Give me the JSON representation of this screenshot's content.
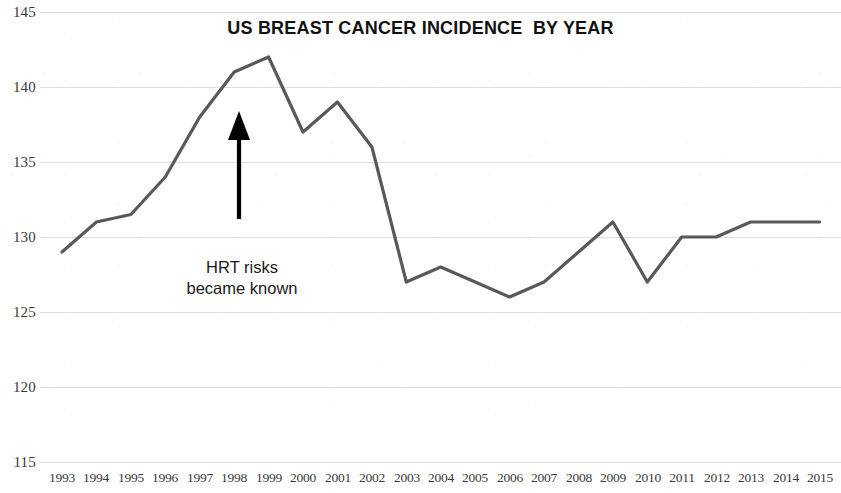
{
  "chart_data": {
    "type": "line",
    "title": "US BREAST CANCER INCIDENCE  BY YEAR",
    "xlabel": "",
    "ylabel": "",
    "categories": [
      "1993",
      "1994",
      "1995",
      "1996",
      "1997",
      "1998",
      "1999",
      "2000",
      "2001",
      "2002",
      "2003",
      "2004",
      "2005",
      "2006",
      "2007",
      "2008",
      "2009",
      "2010",
      "2011",
      "2012",
      "2013",
      "2014",
      "2015"
    ],
    "values": [
      129,
      131,
      131.5,
      134,
      138,
      141,
      142,
      137,
      139,
      136,
      127,
      128,
      127,
      126,
      127,
      129,
      131,
      127,
      130,
      130,
      131,
      131,
      131
    ],
    "series": [
      {
        "name": "US breast cancer incidence",
        "values": [
          129,
          131,
          131.5,
          134,
          138,
          141,
          142,
          137,
          139,
          136,
          127,
          128,
          127,
          126,
          127,
          129,
          131,
          127,
          130,
          130,
          131,
          131,
          131
        ],
        "color": "#595959"
      }
    ],
    "ylim": [
      115,
      145
    ],
    "yticks": [
      115,
      120,
      125,
      130,
      135,
      140,
      145
    ],
    "ytick_labels": [
      "115",
      "120",
      "125",
      "130",
      "135",
      "140",
      "145"
    ],
    "grid": true,
    "grid_color": "#d8d8dc",
    "legend": false,
    "legend_position": "none",
    "annotations": [
      {
        "name": "hrt-risks-note",
        "lines": [
          "HRT risks",
          "became known"
        ],
        "text": "HRT risks became known",
        "marker": "up-arrow",
        "marker_color": "#000000",
        "points_at_year": "1998",
        "points_at_value": 138.5
      }
    ]
  }
}
